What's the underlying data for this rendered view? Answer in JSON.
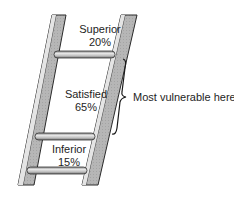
{
  "diagram": {
    "type": "ladder",
    "rungs": [
      {
        "level": "top",
        "name": "Superior",
        "percent": "20%"
      },
      {
        "level": "middle",
        "name": "Satisfied",
        "percent": "65%"
      },
      {
        "level": "bottom",
        "name": "Inferior",
        "percent": "15%"
      }
    ],
    "callout": {
      "text": "Most vulnerable here",
      "target": "Satisfied"
    },
    "colors": {
      "rail_fill": "#b8b8b8",
      "rail_outline": "#2a2a2a",
      "rung_fill": "#c8c8c8",
      "text": "#1e1e1e"
    }
  }
}
